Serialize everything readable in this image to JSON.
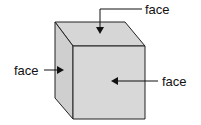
{
  "diagram": {
    "labels": {
      "top": "face",
      "left": "face",
      "front": "face"
    },
    "colors": {
      "fill_top": "#d6d6d6",
      "fill_side": "#d0d0d0",
      "fill_front": "#d8d8d8",
      "stroke": "#222222"
    }
  }
}
